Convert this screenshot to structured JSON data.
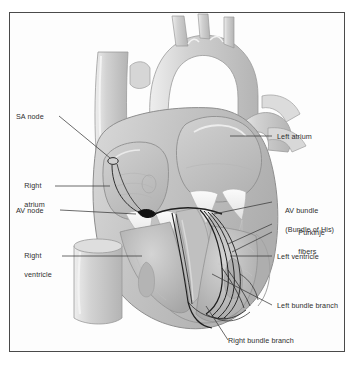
{
  "figure": {
    "type": "anatomical-diagram",
    "border_color": "#4a4a4a",
    "background_color": "#ffffff",
    "label_color": "#2e2e2e",
    "tissue_colors": {
      "light": "#e2e2e2",
      "mid": "#c6c6c6",
      "dark": "#a8a8a8",
      "highlight": "#f4f4f4",
      "outline": "#8e8e8e",
      "conduction": "#1c1c1c"
    }
  },
  "labels": {
    "left": [
      {
        "id": "sa-node",
        "text": "SA node",
        "lines": [
          "SA node"
        ]
      },
      {
        "id": "right-atrium",
        "text": "Right atrium",
        "lines": [
          "Right",
          "atrium"
        ]
      },
      {
        "id": "av-node",
        "text": "AV node",
        "lines": [
          "AV node"
        ]
      },
      {
        "id": "right-ventricle",
        "text": "Right ventricle",
        "lines": [
          "Right",
          "ventricle"
        ]
      }
    ],
    "right": [
      {
        "id": "left-atrium",
        "text": "Left atrium",
        "lines": [
          "Left atrium"
        ]
      },
      {
        "id": "av-bundle",
        "text": "AV bundle (Bundle of His)",
        "lines": [
          "AV bundle",
          "(Bundle of His)"
        ]
      },
      {
        "id": "purkinje",
        "text": "Purkinje fibers",
        "lines": [
          "Purkinje",
          "fibers"
        ]
      },
      {
        "id": "left-ventricle",
        "text": "Left ventricle",
        "lines": [
          "Left ventricle"
        ]
      },
      {
        "id": "left-bundle",
        "text": "Left bundle branch",
        "lines": [
          "Left bundle branch"
        ]
      }
    ],
    "bottom": [
      {
        "id": "right-bundle",
        "text": "Right bundle branch",
        "lines": [
          "Right bundle branch"
        ]
      }
    ]
  },
  "structures": [
    "superior vena cava",
    "aortic arch",
    "brachiocephalic trunk",
    "left common carotid artery",
    "left subclavian artery",
    "pulmonary trunk",
    "pulmonary veins",
    "right atrium",
    "left atrium",
    "right ventricle",
    "left ventricle",
    "interventricular septum",
    "tricuspid valve",
    "mitral valve",
    "chordae tendineae",
    "papillary muscles",
    "inferior vena cava",
    "sinoatrial node",
    "atrioventricular node",
    "atrioventricular bundle",
    "left bundle branch",
    "right bundle branch",
    "Purkinje fibers"
  ]
}
